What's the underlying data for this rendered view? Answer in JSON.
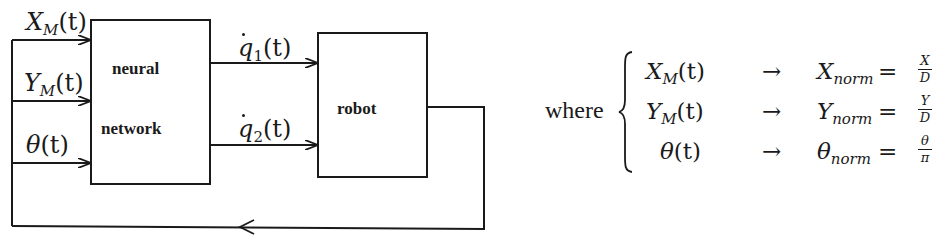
{
  "diagram": {
    "type": "block-diagram",
    "blocks": [
      {
        "id": "neural_network",
        "label_line1": "neural",
        "label_line2": "network"
      },
      {
        "id": "robot",
        "label": "robot"
      }
    ],
    "inputs": [
      {
        "id": "x",
        "symbol": "X",
        "subscript": "M",
        "arg": "(t)"
      },
      {
        "id": "y",
        "symbol": "Y",
        "subscript": "M",
        "arg": "(t)"
      },
      {
        "id": "theta",
        "symbol": "θ",
        "subscript": "",
        "arg": "(t)"
      }
    ],
    "outputs": [
      {
        "id": "q1dot",
        "symbol": "q",
        "subscript": "1",
        "arg": "(t)",
        "accent": "dot"
      },
      {
        "id": "q2dot",
        "symbol": "q",
        "subscript": "2",
        "arg": "(t)",
        "accent": "dot"
      }
    ],
    "edges": [
      {
        "from": "X_M(t)",
        "to": "neural_network"
      },
      {
        "from": "Y_M(t)",
        "to": "neural_network"
      },
      {
        "from": "θ(t)",
        "to": "neural_network"
      },
      {
        "from": "neural_network",
        "to": "robot",
        "label": "q̇1(t)"
      },
      {
        "from": "neural_network",
        "to": "robot",
        "label": "q̇2(t)"
      },
      {
        "from": "robot",
        "to": "inputs",
        "label": "feedback"
      }
    ],
    "colors": {
      "stroke": "#1a1a1a",
      "background": "#ffffff"
    }
  },
  "equations": {
    "intro": "where",
    "arrow": "→",
    "equals": "=",
    "rows": [
      {
        "lhs_symbol": "X",
        "lhs_sub": "M",
        "lhs_arg": "(t)",
        "rhs_symbol": "X",
        "rhs_sub": "norm",
        "num": "X",
        "den": "D"
      },
      {
        "lhs_symbol": "Y",
        "lhs_sub": "M",
        "lhs_arg": "(t)",
        "rhs_symbol": "Y",
        "rhs_sub": "norm",
        "num": "Y",
        "den": "D"
      },
      {
        "lhs_symbol": "θ",
        "lhs_sub": "",
        "lhs_arg": "(t)",
        "rhs_symbol": "θ",
        "rhs_sub": "norm",
        "num": "θ",
        "den": "π"
      }
    ]
  }
}
